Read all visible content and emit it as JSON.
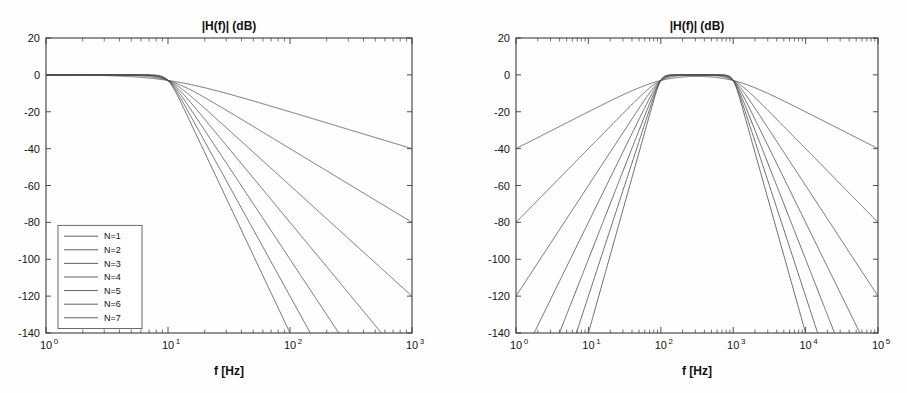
{
  "page": {
    "background_color": "#fefefe",
    "line_color": "#4e4e4e",
    "axis_color": "#3b3b3b"
  },
  "chart_data": [
    {
      "id": "lowpass",
      "type": "line",
      "title": "|H(f)| (dB)",
      "xlabel": "f [Hz]",
      "ylabel": "",
      "xscale": "log",
      "yscale": "linear",
      "xlim": [
        1,
        1000
      ],
      "ylim": [
        -140,
        20
      ],
      "grid": false,
      "xticks": [
        1,
        10,
        100,
        1000
      ],
      "xticklabels": [
        "10^0",
        "10^1",
        "10^2",
        "10^3"
      ],
      "yticks": [
        20,
        0,
        -20,
        -40,
        -60,
        -80,
        -100,
        -120,
        -140
      ],
      "yticklabels": [
        "20",
        "0",
        "-20",
        "-40",
        "-60",
        "-80",
        "-100",
        "-120",
        "-140"
      ],
      "filter": {
        "kind": "butterworth-lowpass",
        "cutoff_hz": 10,
        "rolloff_db_per_decade_per_order": 20
      },
      "legend": {
        "position": "lower-left",
        "entries": [
          "N=1",
          "N=2",
          "N=3",
          "N=4",
          "N=5",
          "N=6",
          "N=7"
        ]
      },
      "series": [
        {
          "name": "N=1",
          "order": 1,
          "points_db": [
            {
              "f": 1,
              "db": -0.04
            },
            {
              "f": 10,
              "db": -3.01
            },
            {
              "f": 100,
              "db": -20.04
            },
            {
              "f": 1000,
              "db": -40.0
            }
          ]
        },
        {
          "name": "N=2",
          "order": 2,
          "points_db": [
            {
              "f": 1,
              "db": -0.01
            },
            {
              "f": 10,
              "db": -3.01
            },
            {
              "f": 100,
              "db": -40.0
            },
            {
              "f": 1000,
              "db": -80.0
            }
          ]
        },
        {
          "name": "N=3",
          "order": 3,
          "points_db": [
            {
              "f": 1,
              "db": 0.0
            },
            {
              "f": 10,
              "db": -3.01
            },
            {
              "f": 100,
              "db": -60.0
            },
            {
              "f": 1000,
              "db": -120.0
            }
          ]
        },
        {
          "name": "N=4",
          "order": 4,
          "points_db": [
            {
              "f": 1,
              "db": 0.0
            },
            {
              "f": 10,
              "db": -3.01
            },
            {
              "f": 100,
              "db": -80.0
            },
            {
              "f": 562,
              "db": -140.0
            }
          ]
        },
        {
          "name": "N=5",
          "order": 5,
          "points_db": [
            {
              "f": 1,
              "db": 0.0
            },
            {
              "f": 10,
              "db": -3.01
            },
            {
              "f": 100,
              "db": -100.0
            },
            {
              "f": 282,
              "db": -140.0
            }
          ]
        },
        {
          "name": "N=6",
          "order": 6,
          "points_db": [
            {
              "f": 1,
              "db": 0.0
            },
            {
              "f": 10,
              "db": -3.01
            },
            {
              "f": 100,
              "db": -120.0
            },
            {
              "f": 178,
              "db": -140.0
            }
          ]
        },
        {
          "name": "N=7",
          "order": 7,
          "points_db": [
            {
              "f": 1,
              "db": 0.0
            },
            {
              "f": 10,
              "db": -3.01
            },
            {
              "f": 100,
              "db": -140.0
            }
          ]
        }
      ]
    },
    {
      "id": "bandpass",
      "type": "line",
      "title": "|H(f)| (dB)",
      "xlabel": "f [Hz]",
      "ylabel": "",
      "xscale": "log",
      "yscale": "linear",
      "xlim": [
        1,
        100000
      ],
      "ylim": [
        -140,
        20
      ],
      "grid": false,
      "xticks": [
        1,
        10,
        100,
        1000,
        10000,
        100000
      ],
      "xticklabels": [
        "10^0",
        "10^1",
        "10^2",
        "10^3",
        "10^4",
        "10^5"
      ],
      "yticks": [
        20,
        0,
        -20,
        -40,
        -60,
        -80,
        -100,
        -120,
        -140
      ],
      "yticklabels": [
        "20",
        "0",
        "-20",
        "-40",
        "-60",
        "-80",
        "-100",
        "-120",
        "-140"
      ],
      "filter": {
        "kind": "butterworth-bandpass",
        "low_cutoff_hz": 100,
        "high_cutoff_hz": 1000,
        "rolloff_db_per_decade_per_order": 20
      },
      "legend": null,
      "series": [
        {
          "name": "N=1",
          "order": 1,
          "points_db": [
            {
              "f": 1,
              "db": -40.0
            },
            {
              "f": 100,
              "db": -3.01
            },
            {
              "f": 1000,
              "db": -3.01
            },
            {
              "f": 100000,
              "db": -40.0
            }
          ]
        },
        {
          "name": "N=2",
          "order": 2,
          "points_db": [
            {
              "f": 1,
              "db": -80.0
            },
            {
              "f": 100,
              "db": -3.01
            },
            {
              "f": 1000,
              "db": -3.01
            },
            {
              "f": 100000,
              "db": -80.0
            }
          ]
        },
        {
          "name": "N=3",
          "order": 3,
          "points_db": [
            {
              "f": 1,
              "db": -120.0
            },
            {
              "f": 100,
              "db": -3.01
            },
            {
              "f": 1000,
              "db": -3.01
            },
            {
              "f": 100000,
              "db": -120.0
            }
          ]
        },
        {
          "name": "N=4",
          "order": 4,
          "points_db": [
            {
              "f": 2.37,
              "db": -140.0
            },
            {
              "f": 100,
              "db": -3.01
            },
            {
              "f": 1000,
              "db": -3.01
            },
            {
              "f": 42170,
              "db": -140.0
            }
          ]
        },
        {
          "name": "N=5",
          "order": 5,
          "points_db": [
            {
              "f": 5.01,
              "db": -140.0
            },
            {
              "f": 100,
              "db": -3.01
            },
            {
              "f": 1000,
              "db": -3.01
            },
            {
              "f": 19950,
              "db": -140.0
            }
          ]
        },
        {
          "name": "N=6",
          "order": 6,
          "points_db": [
            {
              "f": 7.74,
              "db": -140.0
            },
            {
              "f": 100,
              "db": -3.01
            },
            {
              "f": 1000,
              "db": -3.01
            },
            {
              "f": 12920,
              "db": -140.0
            }
          ]
        },
        {
          "name": "N=7",
          "order": 7,
          "points_db": [
            {
              "f": 10.0,
              "db": -140.0
            },
            {
              "f": 100,
              "db": -3.01
            },
            {
              "f": 1000,
              "db": -3.01
            },
            {
              "f": 10000,
              "db": -140.0
            }
          ]
        }
      ]
    }
  ]
}
